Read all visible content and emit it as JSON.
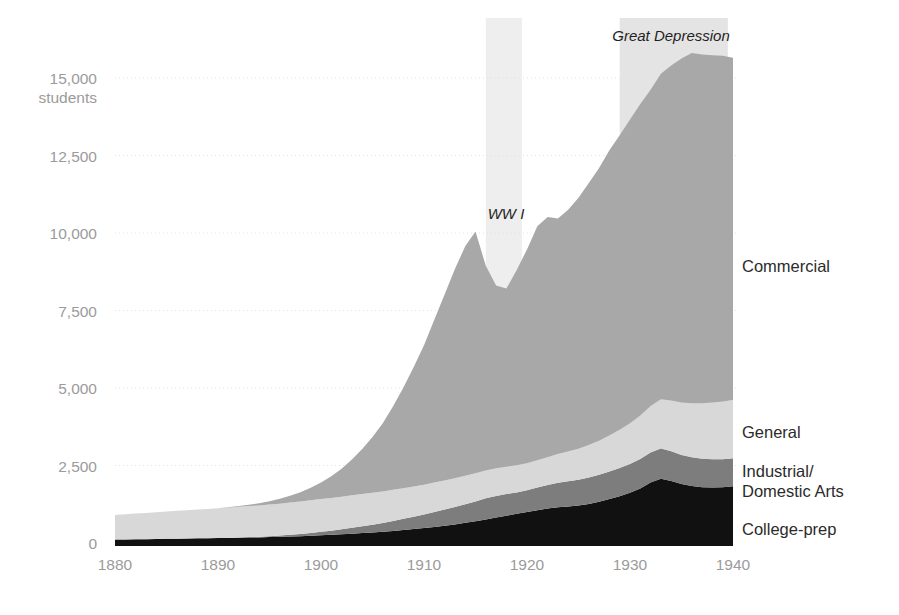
{
  "figure": {
    "background_color": "#ffffff",
    "axis_label_color": "#9b9b9b",
    "series_label_color": "#2b2b2b",
    "annotation_color": "#1f1f1f",
    "gridline_color": "#e2e2e2",
    "baseline_color": "#111111"
  },
  "axes": {
    "y_unit_label": "students",
    "y_ticks": [
      "0",
      "2,500",
      "5,000",
      "7,500",
      "10,000",
      "12,500",
      "15,000"
    ],
    "x_ticks": [
      "1880",
      "1890",
      "1900",
      "1910",
      "1920",
      "1930",
      "1940"
    ]
  },
  "series_labels": {
    "commercial": "Commercial",
    "general": "General",
    "industrial_line1": "Industrial/",
    "industrial_line2": "Domestic Arts",
    "college_prep": "College-prep"
  },
  "annotations": {
    "ww1": "WW I",
    "great_depression": "Great Depression"
  },
  "chart_data": {
    "type": "area",
    "stacked": true,
    "title": "",
    "subtitle": "",
    "xlabel": "",
    "ylabel": "students",
    "xlim": [
      1880,
      1940
    ],
    "ylim": [
      0,
      15000
    ],
    "y_tick_values": [
      0,
      2500,
      5000,
      7500,
      10000,
      12500,
      15000
    ],
    "x_tick_values": [
      1880,
      1890,
      1900,
      1910,
      1920,
      1930,
      1940
    ],
    "grid": "horizontal-dotted",
    "legend_position": "right-inline",
    "colors": {
      "College-prep": "#111111",
      "Industrial/Domestic Arts": "#7d7d7d",
      "General": "#d8d8d8",
      "Commercial": "#a8a8a8"
    },
    "stack_order_bottom_to_top": [
      "College-prep",
      "Industrial/Domestic Arts",
      "General",
      "Commercial"
    ],
    "x": [
      1880,
      1881,
      1882,
      1883,
      1884,
      1885,
      1886,
      1887,
      1888,
      1889,
      1890,
      1891,
      1892,
      1893,
      1894,
      1895,
      1896,
      1897,
      1898,
      1899,
      1900,
      1901,
      1902,
      1903,
      1904,
      1905,
      1906,
      1907,
      1908,
      1909,
      1910,
      1911,
      1912,
      1913,
      1914,
      1915,
      1916,
      1917,
      1918,
      1919,
      1920,
      1921,
      1922,
      1923,
      1924,
      1925,
      1926,
      1927,
      1928,
      1929,
      1930,
      1931,
      1932,
      1933,
      1934,
      1935,
      1936,
      1937,
      1938,
      1939,
      1940
    ],
    "series": [
      {
        "name": "College-prep",
        "values": [
          110,
          115,
          120,
          125,
          130,
          135,
          140,
          145,
          150,
          155,
          160,
          165,
          170,
          175,
          180,
          190,
          200,
          210,
          220,
          235,
          250,
          265,
          280,
          300,
          320,
          340,
          365,
          390,
          420,
          450,
          480,
          520,
          560,
          600,
          650,
          700,
          760,
          820,
          880,
          940,
          1000,
          1060,
          1110,
          1150,
          1180,
          1210,
          1260,
          1330,
          1420,
          1510,
          1620,
          1760,
          1950,
          2070,
          2000,
          1900,
          1840,
          1800,
          1790,
          1800,
          1830
        ]
      },
      {
        "name": "Industrial/Domestic Arts",
        "values": [
          0,
          0,
          0,
          0,
          0,
          0,
          0,
          0,
          0,
          0,
          0,
          0,
          10,
          15,
          20,
          30,
          40,
          55,
          70,
          90,
          110,
          130,
          160,
          190,
          220,
          250,
          280,
          320,
          360,
          400,
          440,
          480,
          520,
          560,
          600,
          640,
          680,
          700,
          700,
          690,
          700,
          730,
          760,
          790,
          810,
          830,
          850,
          870,
          890,
          910,
          930,
          950,
          970,
          980,
          960,
          940,
          930,
          920,
          910,
          905,
          900
        ]
      },
      {
        "name": "General",
        "values": [
          790,
          810,
          830,
          845,
          860,
          880,
          900,
          915,
          930,
          945,
          960,
          975,
          990,
          1000,
          1010,
          1020,
          1030,
          1040,
          1050,
          1055,
          1060,
          1060,
          1055,
          1050,
          1040,
          1030,
          1020,
          1005,
          990,
          975,
          960,
          950,
          940,
          930,
          920,
          910,
          900,
          890,
          880,
          875,
          870,
          880,
          900,
          930,
          960,
          1000,
          1050,
          1100,
          1160,
          1230,
          1310,
          1400,
          1500,
          1590,
          1640,
          1690,
          1740,
          1790,
          1830,
          1860,
          1880
        ]
      },
      {
        "name": "Commercial",
        "values": [
          0,
          0,
          0,
          0,
          0,
          0,
          0,
          0,
          0,
          0,
          0,
          10,
          25,
          45,
          70,
          110,
          160,
          220,
          300,
          400,
          530,
          700,
          900,
          1150,
          1450,
          1800,
          2200,
          2700,
          3250,
          3850,
          4500,
          5250,
          6000,
          6750,
          7400,
          7800,
          6600,
          5900,
          5750,
          6300,
          6900,
          7550,
          7750,
          7600,
          7800,
          8100,
          8450,
          8800,
          9200,
          9500,
          9800,
          10050,
          10200,
          10500,
          10800,
          11100,
          11300,
          11250,
          11200,
          11150,
          11040
        ]
      }
    ],
    "annotation_bands": [
      {
        "label": "WW I",
        "start": 1916,
        "end": 1919.5,
        "color": "#eeeeee"
      },
      {
        "label": "Great Depression",
        "start": 1929,
        "end": 1939.5,
        "color": "#e4e4e4"
      }
    ]
  }
}
